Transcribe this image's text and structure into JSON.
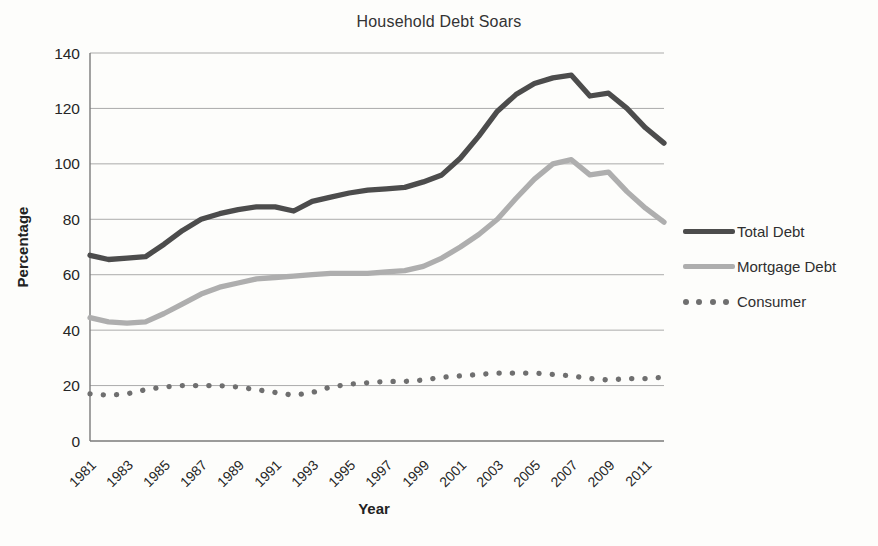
{
  "chart_data": {
    "type": "line",
    "title": "Household Debt Soars",
    "xlabel": "Year",
    "ylabel": "Percentage",
    "ylim": [
      0,
      140
    ],
    "ytick_step": 20,
    "grid": true,
    "legend_position": "right",
    "x": [
      1981,
      1982,
      1983,
      1984,
      1985,
      1986,
      1987,
      1988,
      1989,
      1990,
      1991,
      1992,
      1993,
      1994,
      1995,
      1996,
      1997,
      1998,
      1999,
      2000,
      2001,
      2002,
      2003,
      2004,
      2005,
      2006,
      2007,
      2008,
      2009,
      2010,
      2011,
      2012
    ],
    "xtick_labels": [
      "1981",
      "1983",
      "1985",
      "1987",
      "1989",
      "1991",
      "1993",
      "1995",
      "1997",
      "1999",
      "2001",
      "2003",
      "2005",
      "2007",
      "2009",
      "2011"
    ],
    "series": [
      {
        "name": "Total Debt",
        "color": "#4c4c4c",
        "line_style": "solid",
        "values": [
          67,
          65.5,
          66,
          66.5,
          71,
          76,
          80,
          82,
          83.5,
          84.5,
          84.5,
          83,
          86.5,
          88,
          89.5,
          90.5,
          91,
          91.5,
          93.5,
          96,
          102,
          110,
          119,
          125,
          129,
          131,
          132,
          124.5,
          125.5,
          120,
          113,
          107.5
        ]
      },
      {
        "name": "Mortgage Debt",
        "color": "#aeaeae",
        "line_style": "solid",
        "values": [
          44.5,
          43,
          42.5,
          43,
          46,
          49.5,
          53,
          55.5,
          57,
          58.5,
          59,
          59.5,
          60,
          60.5,
          60.5,
          60.5,
          61,
          61.5,
          63,
          66,
          70,
          74.5,
          80,
          87.5,
          94.5,
          100,
          101.5,
          96,
          97,
          90,
          84,
          79
        ]
      },
      {
        "name": "Consumer",
        "color": "#6f6f6f",
        "line_style": "dotted",
        "values": [
          17,
          16.5,
          17,
          18.5,
          19.5,
          20,
          20,
          20,
          19.5,
          18.5,
          17.5,
          16.5,
          17.5,
          19.5,
          20.5,
          21,
          21.5,
          21.5,
          22,
          23,
          23.5,
          24,
          24.5,
          24.5,
          24.5,
          24,
          23.5,
          22.5,
          22,
          22.5,
          22.5,
          23
        ]
      }
    ],
    "axis_color": "#7a7a7a",
    "gridline_color": "#989898",
    "tick_label_color": "#262626"
  }
}
